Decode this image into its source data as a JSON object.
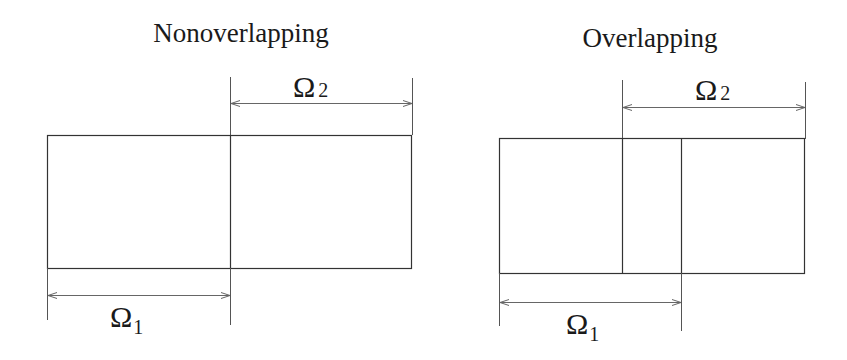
{
  "diagrams": {
    "left": {
      "title": "Nonoverlapping",
      "omega2": {
        "symbol": "Ω",
        "subscript": "2"
      },
      "omega1": {
        "symbol": "Ω",
        "subscript": "1"
      }
    },
    "right": {
      "title": "Overlapping",
      "omega2": {
        "symbol": "Ω",
        "subscript": "2"
      },
      "omega1": {
        "symbol": "Ω",
        "subscript": "1"
      }
    }
  },
  "colors": {
    "background": "#ffffff",
    "stroke": "#333333",
    "text": "#1a1a1a"
  }
}
